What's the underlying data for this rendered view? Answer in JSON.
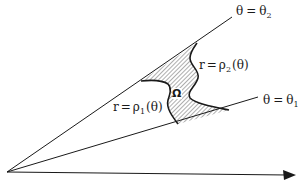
{
  "diagram": {
    "type": "polar-region",
    "labels": {
      "upper_ray": {
        "lhs": "θ",
        "eq": "=",
        "rhs": "θ",
        "sub": "2"
      },
      "lower_ray": {
        "lhs": "θ",
        "eq": "=",
        "rhs": "θ",
        "sub": "1"
      },
      "outer_curve": {
        "lhs": "r",
        "eq": "=",
        "fn": "ρ",
        "sub": "2",
        "arg": "(θ)"
      },
      "inner_curve": {
        "lhs": "r",
        "eq": "=",
        "fn": "ρ",
        "sub": "1",
        "arg": "(θ)"
      },
      "region": "Ω"
    },
    "colors": {
      "stroke": "#1a1a1a",
      "hatch": "#333333",
      "background": "#ffffff"
    }
  }
}
